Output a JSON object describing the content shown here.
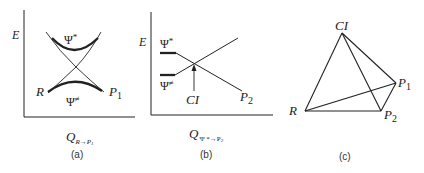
{
  "panels": {
    "a": {
      "caption": "(a)",
      "y_axis_label": "E",
      "x_axis_label_main": "Q",
      "x_axis_label_sub": "R→P",
      "x_axis_label_subsub": "1",
      "upper_state": "Ψ",
      "upper_state_sup": "*",
      "lower_state": "Ψ",
      "lower_state_sup": "≠",
      "left_point": "R",
      "right_point": "P",
      "right_point_sub": "1"
    },
    "b": {
      "caption": "(b)",
      "y_axis_label": "E",
      "x_axis_label_main": "Q",
      "x_axis_label_sub": "Ψ *→P",
      "x_axis_label_subsub": "2",
      "upper_state": "Ψ",
      "upper_state_sup": "*",
      "lower_state": "Ψ",
      "lower_state_sup": "≠",
      "crossing_label": "CI",
      "end_point": "P",
      "end_point_sub": "2"
    },
    "c": {
      "caption": "(c)",
      "vertices": {
        "top": "CI",
        "left": "R",
        "right_upper": "P",
        "right_upper_sub": "1",
        "right_lower": "P",
        "right_lower_sub": "2"
      }
    }
  }
}
